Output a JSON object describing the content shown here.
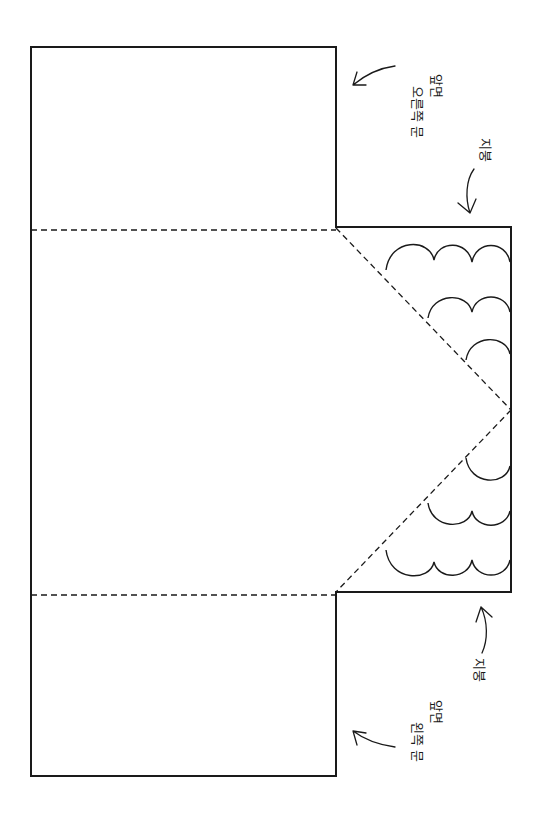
{
  "diagram": {
    "type": "paper-house-template",
    "colors": {
      "line": "#1a1a1a",
      "background": "#ffffff"
    },
    "panels": [
      {
        "id": "right-door-panel",
        "role": "오른쪽 문 / 앞면"
      },
      {
        "id": "center-panel",
        "role": "body"
      },
      {
        "id": "roof-tab",
        "role": "지붕"
      },
      {
        "id": "left-door-panel",
        "role": "왼쪽 문 / 앞면"
      }
    ],
    "labels": {
      "top_door_line1": "앞면",
      "top_door_line2": "오른쪽 문",
      "top_roof": "지붕",
      "bottom_roof": "지붕",
      "bottom_door_line1": "앞면",
      "bottom_door_line2": "왼쪽 문"
    },
    "fold_lines": [
      "top-horizontal",
      "bottom-horizontal",
      "roof-diagonal-upper",
      "roof-diagonal-lower"
    ],
    "scallop_rows": [
      {
        "position": "top",
        "arcs": 3
      },
      {
        "position": "top",
        "arcs": 2
      },
      {
        "position": "top",
        "arcs": 1
      },
      {
        "position": "bottom",
        "arcs": 1
      },
      {
        "position": "bottom",
        "arcs": 2
      },
      {
        "position": "bottom",
        "arcs": 3
      }
    ]
  }
}
